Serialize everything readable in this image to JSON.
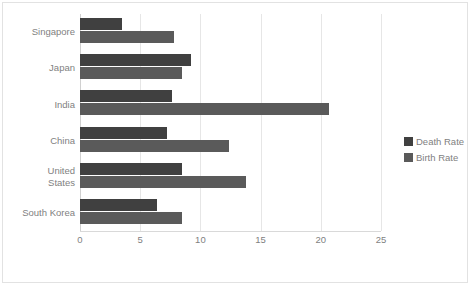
{
  "chart_data": {
    "type": "bar",
    "orientation": "horizontal",
    "title": "",
    "xlabel": "",
    "ylabel": "",
    "categories": [
      "Singapore",
      "Japan",
      "India",
      "China",
      "United States",
      "South Korea"
    ],
    "series": [
      {
        "name": "Death Rate",
        "color": "#404040",
        "values": [
          3.5,
          9.2,
          7.6,
          7.2,
          8.5,
          6.4
        ]
      },
      {
        "name": "Birth Rate",
        "color": "#5a5a5a",
        "values": [
          7.8,
          8.5,
          20.7,
          12.4,
          13.8,
          8.5
        ]
      }
    ],
    "xlim": [
      0,
      25
    ],
    "xticks": [
      0,
      5,
      10,
      15,
      20,
      25
    ],
    "xtick_labels": [
      "0",
      "5",
      "10",
      "15",
      "20",
      "25"
    ],
    "grid": true,
    "legend_position": "right",
    "legend": [
      "Death Rate",
      "Birth Rate"
    ],
    "colors": {
      "death_rate": "#404040",
      "birth_rate": "#5a5a5a",
      "gridline": "#e6e6e6",
      "axis": "#d9d9d9",
      "text": "#7f7f7f",
      "border": "#e2e2e2",
      "background": "#ffffff"
    }
  }
}
